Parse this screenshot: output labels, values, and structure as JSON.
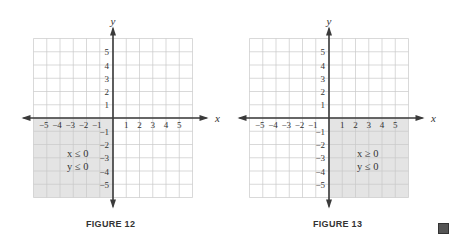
{
  "chart_data": [
    {
      "type": "region",
      "title": "FIGURE 12",
      "xlabel": "x",
      "ylabel": "y",
      "xlim": [
        -6,
        6
      ],
      "ylim": [
        -6,
        6
      ],
      "grid": true,
      "x_ticks": [
        -5,
        -4,
        -3,
        -2,
        -1,
        1,
        2,
        3,
        4,
        5
      ],
      "y_ticks": [
        5,
        4,
        3,
        2,
        1,
        -1,
        -2,
        -3,
        -4,
        -5
      ],
      "shaded_region": "third quadrant",
      "annotation": [
        "x ≤ 0",
        "y ≤ 0"
      ]
    },
    {
      "type": "region",
      "title": "FIGURE 13",
      "xlabel": "x",
      "ylabel": "y",
      "xlim": [
        -6,
        6
      ],
      "ylim": [
        -6,
        6
      ],
      "grid": true,
      "x_ticks": [
        -5,
        -4,
        -3,
        -2,
        -1,
        1,
        2,
        3,
        4,
        5
      ],
      "y_ticks": [
        5,
        4,
        3,
        2,
        1,
        -1,
        -2,
        -3,
        -4,
        -5
      ],
      "shaded_region": "fourth quadrant",
      "annotation": [
        "x ≥ 0",
        "y ≤ 0"
      ]
    }
  ],
  "figures": [
    {
      "caption": "FIGURE 12",
      "xlabel": "x",
      "ylabel": "y",
      "ineq1": "x ≤ 0",
      "ineq2": "y ≤ 0"
    },
    {
      "caption": "FIGURE 13",
      "xlabel": "x",
      "ylabel": "y",
      "ineq1": "x ≥ 0",
      "ineq2": "y ≤ 0"
    }
  ],
  "colors": {
    "shade": "#e4e4e4",
    "grid": "#c8c8c8",
    "axis": "#3a3a3a"
  }
}
